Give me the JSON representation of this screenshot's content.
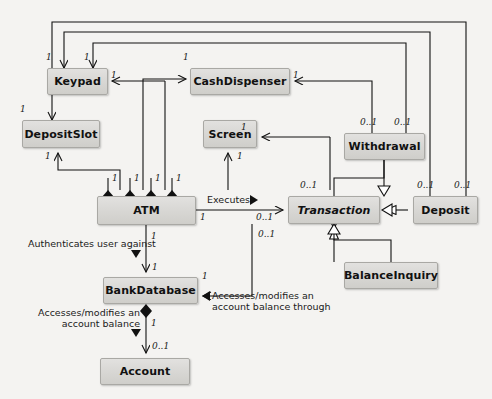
{
  "diagram": {
    "type": "uml-class-diagram",
    "background_color": "#f4f3f1",
    "box_fill_color": "#d9d8d5",
    "border_color": "#808080",
    "line_color": "#1a1a1a"
  },
  "classes": [
    {
      "id": "keypad",
      "name": "Keypad",
      "abstract": false,
      "x": 47,
      "y": 68,
      "w": 61,
      "h": 27
    },
    {
      "id": "cashdispenser",
      "name": "CashDispenser",
      "abstract": false,
      "x": 190,
      "y": 68,
      "w": 100,
      "h": 27
    },
    {
      "id": "depositslot",
      "name": "DepositSlot",
      "abstract": false,
      "x": 22,
      "y": 120,
      "w": 78,
      "h": 28
    },
    {
      "id": "screen",
      "name": "Screen",
      "abstract": false,
      "x": 203,
      "y": 120,
      "w": 54,
      "h": 28
    },
    {
      "id": "withdrawal",
      "name": "Withdrawal",
      "abstract": false,
      "x": 344,
      "y": 133,
      "w": 81,
      "h": 27
    },
    {
      "id": "atm",
      "name": "ATM",
      "abstract": false,
      "x": 97,
      "y": 196,
      "w": 99,
      "h": 29
    },
    {
      "id": "transaction",
      "name": "Transaction",
      "abstract": true,
      "x": 288,
      "y": 196,
      "w": 92,
      "h": 28
    },
    {
      "id": "deposit",
      "name": "Deposit",
      "abstract": false,
      "x": 413,
      "y": 196,
      "w": 65,
      "h": 28
    },
    {
      "id": "balanceinquiry",
      "name": "BalanceInquiry",
      "abstract": false,
      "x": 344,
      "y": 262,
      "w": 94,
      "h": 27
    },
    {
      "id": "bankdatabase",
      "name": "BankDatabase",
      "abstract": false,
      "x": 103,
      "y": 277,
      "w": 95,
      "h": 27
    },
    {
      "id": "account",
      "name": "Account",
      "abstract": false,
      "x": 100,
      "y": 358,
      "w": 90,
      "h": 27
    }
  ],
  "association_labels": [
    {
      "id": "executes",
      "text": "Executes",
      "x": 207,
      "y": 194
    },
    {
      "id": "authenticates-user-against",
      "text": "Authenticates user against",
      "x": 28,
      "y": 238
    },
    {
      "id": "accesses-modifies-balance",
      "line1": "Accesses/modifies an",
      "line2": "account balance",
      "x": 24,
      "y": 310
    },
    {
      "id": "accesses-modifies-through",
      "line1": "Accesses/modifies an",
      "line2": "account balance through",
      "x": 206,
      "y": 293
    }
  ],
  "multiplicities": [
    {
      "id": "mult-keypad-left",
      "text": "1",
      "x": 46,
      "y": 52
    },
    {
      "id": "mult-keypad-right",
      "text": "1",
      "x": 84,
      "y": 52
    },
    {
      "id": "mult-keypad-assoc",
      "text": "1",
      "x": 111,
      "y": 74
    },
    {
      "id": "mult-cashdisp-left",
      "text": "1",
      "x": 183,
      "y": 52
    },
    {
      "id": "mult-cashdisp-right",
      "text": "1",
      "x": 293,
      "y": 74
    },
    {
      "id": "mult-depositslot-top",
      "text": "1",
      "x": 20,
      "y": 105
    },
    {
      "id": "mult-depositslot-bottom",
      "text": "1",
      "x": 45,
      "y": 152
    },
    {
      "id": "mult-screen-right",
      "text": "1",
      "x": 241,
      "y": 124
    },
    {
      "id": "mult-screen-bottom",
      "text": "1",
      "x": 237,
      "y": 152
    },
    {
      "id": "mult-withdrawal-a",
      "text": "0..1",
      "x": 362,
      "y": 119
    },
    {
      "id": "mult-withdrawal-b",
      "text": "0..1",
      "x": 396,
      "y": 119
    },
    {
      "id": "mult-deposit-a",
      "text": "0..1",
      "x": 418,
      "y": 182
    },
    {
      "id": "mult-deposit-b",
      "text": "0..1",
      "x": 455,
      "y": 182
    },
    {
      "id": "mult-atm-diamond-1",
      "text": "1",
      "x": 112,
      "y": 174
    },
    {
      "id": "mult-atm-diamond-2",
      "text": "1",
      "x": 134,
      "y": 174
    },
    {
      "id": "mult-atm-diamond-3",
      "text": "1",
      "x": 155,
      "y": 174
    },
    {
      "id": "mult-atm-diamond-4",
      "text": "1",
      "x": 176,
      "y": 174
    },
    {
      "id": "mult-atm-exec",
      "text": "1",
      "x": 200,
      "y": 214
    },
    {
      "id": "mult-atm-bankdb",
      "text": "1",
      "x": 150,
      "y": 233
    },
    {
      "id": "mult-bankdb-top",
      "text": "1",
      "x": 152,
      "y": 264
    },
    {
      "id": "mult-bankdb-right",
      "text": "1",
      "x": 202,
      "y": 273
    },
    {
      "id": "mult-bankdb-account",
      "text": "1",
      "x": 150,
      "y": 320
    },
    {
      "id": "mult-account-top",
      "text": "0..1",
      "x": 152,
      "y": 343
    },
    {
      "id": "mult-transaction-top",
      "text": "0..1",
      "x": 302,
      "y": 182
    },
    {
      "id": "mult-transaction-exec",
      "text": "0..1",
      "x": 258,
      "y": 214
    },
    {
      "id": "mult-transaction-bottom",
      "text": "0..1",
      "x": 260,
      "y": 231
    }
  ],
  "relationships": [
    {
      "from": "atm",
      "to": "keypad",
      "type": "composition",
      "atm_multiplicity": "1",
      "part_multiplicity": "1"
    },
    {
      "from": "atm",
      "to": "cashdispenser",
      "type": "composition",
      "atm_multiplicity": "1",
      "part_multiplicity": "1"
    },
    {
      "from": "atm",
      "to": "depositslot",
      "type": "composition",
      "atm_multiplicity": "1",
      "part_multiplicity": "1"
    },
    {
      "from": "atm",
      "to": "screen",
      "type": "composition",
      "atm_multiplicity": "1",
      "part_multiplicity": "1"
    },
    {
      "from": "atm",
      "to": "transaction",
      "type": "association",
      "label": "Executes"
    },
    {
      "from": "atm",
      "to": "bankdatabase",
      "type": "association",
      "label": "Authenticates user against"
    },
    {
      "from": "bankdatabase",
      "to": "account",
      "type": "composition",
      "label": "Accesses/modifies an account balance"
    },
    {
      "from": "transaction",
      "to": "bankdatabase",
      "type": "association",
      "label": "Accesses/modifies an account balance through"
    },
    {
      "from": "withdrawal",
      "to": "transaction",
      "type": "generalization"
    },
    {
      "from": "deposit",
      "to": "transaction",
      "type": "generalization"
    },
    {
      "from": "balanceinquiry",
      "to": "transaction",
      "type": "generalization"
    },
    {
      "from": "withdrawal",
      "to": "keypad",
      "type": "association"
    },
    {
      "from": "withdrawal",
      "to": "cashdispenser",
      "type": "association"
    },
    {
      "from": "withdrawal",
      "to": "screen",
      "type": "association"
    },
    {
      "from": "deposit",
      "to": "keypad",
      "type": "association"
    },
    {
      "from": "deposit",
      "to": "depositslot",
      "type": "association"
    },
    {
      "from": "deposit",
      "to": "screen",
      "type": "association"
    },
    {
      "from": "balanceinquiry",
      "to": "screen",
      "type": "association"
    }
  ]
}
